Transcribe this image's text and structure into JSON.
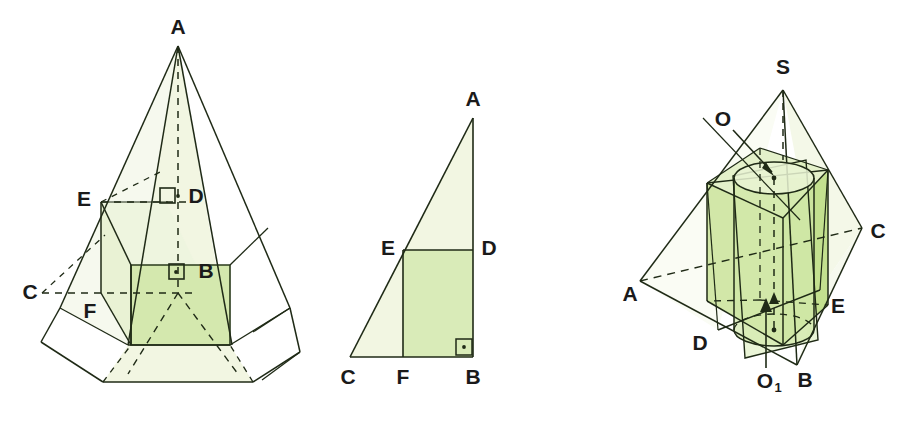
{
  "page": {
    "background": "#ffffff",
    "width": 920,
    "height": 427
  },
  "palette": {
    "stroke": "#1f2a16",
    "label_color": "#1a1a1a",
    "fill_light": "#f2f6e2",
    "fill_mid": "#e9f2d4",
    "fill_strong": "#d4e8ae",
    "fill_face": "#cfe6a6",
    "white": "#ffffff"
  },
  "figures": [
    {
      "id": "figure-pyramid-with-inscribed-prism",
      "name": "Quadrilateral pyramid with inscribed rectangular prism",
      "labels": [
        {
          "name": "label-A",
          "text": "A",
          "x": 178,
          "y": 28
        },
        {
          "name": "label-E",
          "text": "E",
          "x": 84,
          "y": 200
        },
        {
          "name": "label-D",
          "text": "D",
          "x": 196,
          "y": 197
        },
        {
          "name": "label-C",
          "text": "C",
          "x": 30,
          "y": 293
        },
        {
          "name": "label-F",
          "text": "F",
          "x": 90,
          "y": 312
        },
        {
          "name": "label-B",
          "text": "B",
          "x": 206,
          "y": 272
        }
      ],
      "marks": [
        {
          "name": "right-angle-mark-D",
          "x": 168,
          "y": 196
        },
        {
          "name": "right-angle-mark-B",
          "x": 176,
          "y": 272
        }
      ]
    },
    {
      "id": "figure-right-triangle-cross-section",
      "name": "Right triangle cross-section with inscribed rectangle",
      "labels": [
        {
          "name": "label-A",
          "text": "A",
          "x": 473,
          "y": 100
        },
        {
          "name": "label-E",
          "text": "E",
          "x": 388,
          "y": 249
        },
        {
          "name": "label-D",
          "text": "D",
          "x": 489,
          "y": 249
        },
        {
          "name": "label-C",
          "text": "C",
          "x": 348,
          "y": 378
        },
        {
          "name": "label-F",
          "text": "F",
          "x": 403,
          "y": 378
        },
        {
          "name": "label-B",
          "text": "B",
          "x": 473,
          "y": 378
        }
      ],
      "marks": [
        {
          "name": "right-angle-mark-B",
          "x": 463,
          "y": 348
        }
      ]
    },
    {
      "id": "figure-tetrahedron-with-prism-and-cylinder",
      "name": "Pyramid S-ABC with inscribed prism and cylinder",
      "labels": [
        {
          "name": "label-S",
          "text": "S",
          "x": 783,
          "y": 68
        },
        {
          "name": "label-O",
          "text": "O",
          "x": 723,
          "y": 120
        },
        {
          "name": "label-C",
          "text": "C",
          "x": 878,
          "y": 232
        },
        {
          "name": "label-A",
          "text": "A",
          "x": 630,
          "y": 295
        },
        {
          "name": "label-E",
          "text": "E",
          "x": 838,
          "y": 307
        },
        {
          "name": "label-D",
          "text": "D",
          "x": 700,
          "y": 344
        },
        {
          "name": "label-O1",
          "text": "O",
          "sub": "1",
          "x": 768,
          "y": 382
        },
        {
          "name": "label-B",
          "text": "B",
          "x": 805,
          "y": 381
        }
      ],
      "annotations": [
        {
          "name": "leader-line-O",
          "from": [
            733,
            130
          ],
          "to": [
            779,
            176
          ]
        },
        {
          "name": "leader-line-O1",
          "from": [
            766,
            368
          ],
          "to": [
            766,
            300
          ]
        }
      ]
    }
  ]
}
